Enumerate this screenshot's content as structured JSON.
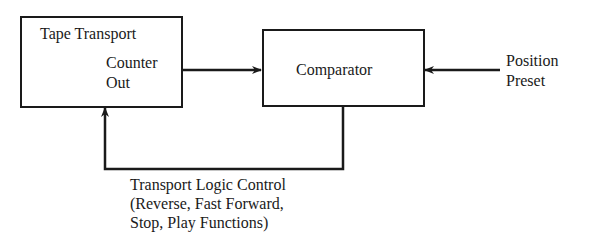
{
  "blocks": {
    "tape_transport": {
      "title": "Tape Transport",
      "output_line1": "Counter",
      "output_line2": "Out"
    },
    "comparator": {
      "label": "Comparator"
    }
  },
  "inputs": {
    "position_preset_line1": "Position",
    "position_preset_line2": "Preset"
  },
  "feedback": {
    "line1": "Transport Logic Control",
    "line2": "(Reverse, Fast Forward,",
    "line3": "Stop, Play Functions)"
  },
  "colors": {
    "line": "#1a1a1a",
    "background": "#ffffff"
  }
}
